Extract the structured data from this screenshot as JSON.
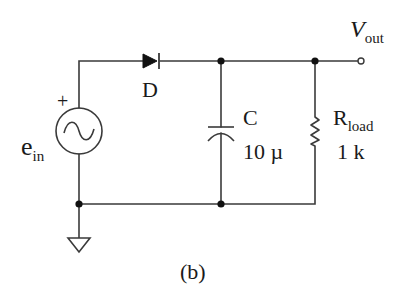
{
  "figure": {
    "caption": "(b)",
    "stroke_color": "#3a3a3a",
    "fill_color": "#111111",
    "background": "#ffffff"
  },
  "components": {
    "source": {
      "name": "e",
      "subscript": "in",
      "polarity": "+",
      "icon": "ac-voltage-source-icon"
    },
    "diode": {
      "label": "D",
      "icon": "diode-icon"
    },
    "capacitor": {
      "label": "C",
      "value": "10 µ",
      "icon": "capacitor-icon"
    },
    "resistor": {
      "label": "R",
      "subscript": "load",
      "value": "1 k",
      "icon": "resistor-icon"
    },
    "output": {
      "label": "V",
      "subscript": "out",
      "icon": "output-terminal-icon"
    },
    "ground": {
      "icon": "ground-icon"
    }
  }
}
